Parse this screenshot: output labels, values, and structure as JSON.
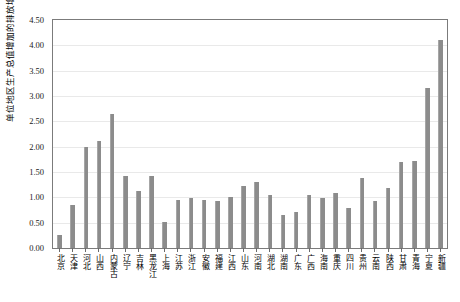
{
  "chart_data": {
    "type": "bar",
    "title": "",
    "subtitle": "",
    "xlabel": "",
    "ylabel": "单位地区生产总值增加的排放增加(吨/万元)",
    "ylim": [
      0.0,
      4.5
    ],
    "ytick_step": 0.5,
    "yticks": [
      "0.00",
      "0.50",
      "1.00",
      "1.50",
      "2.00",
      "2.50",
      "3.00",
      "3.50",
      "4.00",
      "4.50"
    ],
    "grid": true,
    "legend": null,
    "bar_color": "#8c8c8c",
    "axis_color": "#7b7b7b",
    "grid_color": "#e9e9e9",
    "categories": [
      "北京",
      "天津",
      "河北",
      "山西",
      "内蒙古",
      "辽宁",
      "吉林",
      "黑龙江",
      "上海",
      "江苏",
      "浙江",
      "安徽",
      "福建",
      "江西",
      "山东",
      "河南",
      "湖北",
      "湖南",
      "广东",
      "广西",
      "海南",
      "重庆",
      "四川",
      "贵州",
      "云南",
      "陕西",
      "甘肃",
      "青海",
      "宁夏",
      "新疆"
    ],
    "values": [
      0.25,
      0.85,
      2.0,
      2.12,
      2.65,
      1.42,
      1.12,
      1.42,
      0.52,
      0.95,
      0.98,
      0.95,
      0.93,
      1.0,
      1.22,
      1.3,
      1.05,
      0.65,
      0.72,
      1.05,
      0.98,
      1.08,
      0.78,
      1.38,
      0.92,
      1.18,
      1.7,
      1.72,
      3.15,
      4.1
    ]
  }
}
